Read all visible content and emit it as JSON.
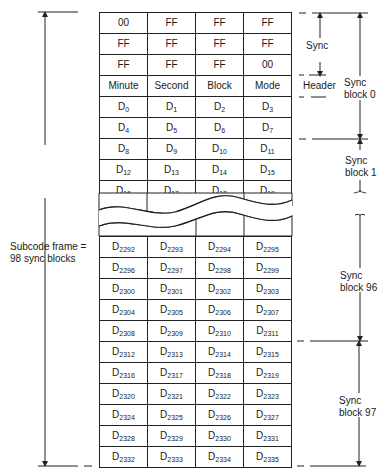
{
  "diagram": {
    "columns": 4,
    "top_rows": [
      [
        "00",
        "FF",
        "FF",
        "FF"
      ],
      [
        "FF",
        "FF",
        "FF",
        "FF"
      ],
      [
        "FF",
        "FF",
        "FF",
        "00"
      ],
      [
        "Minute",
        "Second",
        "Block",
        "Mode"
      ],
      [
        "D|0",
        "D|1",
        "D|2",
        "D|3"
      ],
      [
        "D|4",
        "D|5",
        "D|6",
        "D|7"
      ],
      [
        "D|8",
        "D|9",
        "D|10",
        "D|11"
      ],
      [
        "D|12",
        "D|13",
        "D|14",
        "D|15"
      ],
      [
        "D|16",
        "D|17",
        "D|18",
        "D|19"
      ]
    ],
    "bottom_rows": [
      [
        "D|2292",
        "D|2293",
        "D|2294",
        "D|2295"
      ],
      [
        "D|2296",
        "D|2297",
        "D|2298",
        "D|2299"
      ],
      [
        "D|2300",
        "D|2301",
        "D|2302",
        "D|2303"
      ],
      [
        "D|2304",
        "D|2305",
        "D|2306",
        "D|2307"
      ],
      [
        "D|2308",
        "D|2309",
        "D|2310",
        "D|2311"
      ],
      [
        "D|2312",
        "D|2313",
        "D|2314",
        "D|2315"
      ],
      [
        "D|2316",
        "D|2317",
        "D|2318",
        "D|2319"
      ],
      [
        "D|2320",
        "D|2321",
        "D|2322",
        "D|2323"
      ],
      [
        "D|2324",
        "D|2325",
        "D|2326",
        "D|2327"
      ],
      [
        "D|2328",
        "D|2329",
        "D|2330",
        "D|2331"
      ],
      [
        "D|2332",
        "D|2333",
        "D|2334",
        "D|2335"
      ]
    ],
    "labels": {
      "subcode_frame_line1": "Subcode frame =",
      "subcode_frame_line2": "98 sync blocks",
      "sync": "Sync",
      "header": "Header",
      "sync_block_0_line1": "Sync",
      "sync_block_0_line2": "block 0",
      "sync_block_1_line1": "Sync",
      "sync_block_1_line2": "block 1",
      "sync_block_96_line1": "Sync",
      "sync_block_96_line2": "block 96",
      "sync_block_97_line1": "Sync",
      "sync_block_97_line2": "block 97"
    },
    "colors": {
      "line": "#222222",
      "background": "#ffffff",
      "text": "#1a1a1a"
    }
  }
}
